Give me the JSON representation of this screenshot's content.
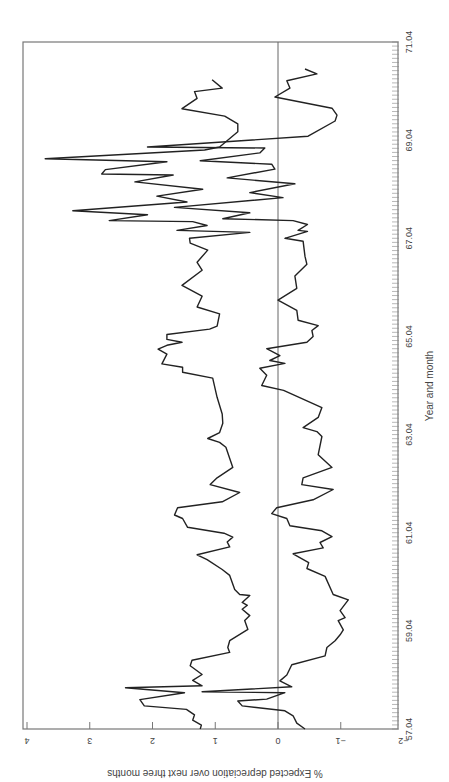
{
  "chart_data": {
    "type": "line",
    "orientation": "rotated 90 degrees clockwise (time axis runs bottom-to-top along right edge)",
    "title": "",
    "xlabel": "Year and month",
    "ylabel": "% Expected depreciation over next three months",
    "x_ticks": [
      "57.04",
      "59.04",
      "61.04",
      "63.04",
      "65.04",
      "67.04",
      "69.04",
      "71.04"
    ],
    "y_ticks": [
      "4",
      "3",
      "2",
      "1",
      "0",
      "−1",
      "−2"
    ],
    "xlim": [
      57.04,
      71.04
    ],
    "ylim": [
      -2,
      4
    ],
    "grid": false,
    "reference_line": {
      "y": 0
    },
    "legend": null,
    "series": [
      {
        "name": "upper band",
        "points": [
          [
            57.04,
            1.24
          ],
          [
            57.12,
            1.22
          ],
          [
            57.22,
            1.36
          ],
          [
            57.33,
            1.33
          ],
          [
            57.44,
            1.46
          ],
          [
            57.51,
            2.13
          ],
          [
            57.64,
            2.2
          ],
          [
            57.78,
            1.49
          ],
          [
            57.88,
            2.43
          ],
          [
            57.92,
            1.21
          ],
          [
            58.03,
            1.36
          ],
          [
            58.15,
            1.21
          ],
          [
            58.33,
            1.4
          ],
          [
            58.44,
            1.37
          ],
          [
            58.6,
            0.77
          ],
          [
            58.7,
            0.8
          ],
          [
            58.84,
            0.77
          ],
          [
            59.07,
            0.48
          ],
          [
            59.25,
            0.53
          ],
          [
            59.35,
            0.45
          ],
          [
            59.48,
            0.57
          ],
          [
            59.56,
            0.49
          ],
          [
            59.62,
            0.57
          ],
          [
            59.76,
            0.45
          ],
          [
            59.78,
            0.61
          ],
          [
            59.88,
            0.69
          ],
          [
            60.17,
            0.77
          ],
          [
            60.29,
            0.89
          ],
          [
            60.49,
            1.13
          ],
          [
            60.59,
            1.29
          ],
          [
            60.75,
            0.77
          ],
          [
            60.85,
            0.81
          ],
          [
            60.95,
            0.72
          ],
          [
            61.03,
            0.86
          ],
          [
            61.15,
            1.44
          ],
          [
            61.33,
            1.52
          ],
          [
            61.4,
            1.65
          ],
          [
            61.55,
            1.6
          ],
          [
            61.67,
            0.89
          ],
          [
            61.86,
            0.61
          ],
          [
            62.02,
            1.08
          ],
          [
            62.16,
            0.97
          ],
          [
            62.37,
            0.72
          ],
          [
            62.78,
            0.83
          ],
          [
            62.88,
            0.93
          ],
          [
            62.96,
            1.12
          ],
          [
            63.08,
            0.93
          ],
          [
            63.27,
            0.88
          ],
          [
            63.46,
            0.89
          ],
          [
            63.8,
            0.97
          ],
          [
            64.19,
            1.04
          ],
          [
            64.31,
            1.52
          ],
          [
            64.41,
            1.52
          ],
          [
            64.48,
            1.85
          ],
          [
            64.68,
            1.77
          ],
          [
            64.78,
            1.91
          ],
          [
            64.86,
            1.77
          ],
          [
            64.92,
            1.53
          ],
          [
            64.98,
            1.77
          ],
          [
            65.08,
            1.77
          ],
          [
            65.19,
            1.09
          ],
          [
            65.25,
            0.97
          ],
          [
            65.5,
            0.93
          ],
          [
            65.64,
            1.29
          ],
          [
            65.86,
            1.21
          ],
          [
            66.08,
            1.53
          ],
          [
            66.39,
            1.21
          ],
          [
            66.55,
            1.29
          ],
          [
            66.8,
            1.12
          ],
          [
            66.94,
            1.4
          ],
          [
            67.04,
            1.41
          ],
          [
            67.16,
            0.45
          ],
          [
            67.2,
            1.61
          ],
          [
            67.3,
            1.13
          ],
          [
            67.38,
            1.36
          ],
          [
            67.4,
            2.69
          ],
          [
            67.52,
            2.08
          ],
          [
            67.6,
            3.27
          ],
          [
            67.78,
            1.45
          ],
          [
            67.9,
            1.93
          ],
          [
            68.04,
            1.2
          ],
          [
            68.19,
            2.28
          ],
          [
            68.33,
            1.67
          ],
          [
            68.35,
            2.81
          ],
          [
            68.44,
            2.75
          ],
          [
            68.6,
            1.77
          ],
          [
            68.66,
            3.71
          ],
          [
            68.84,
            1.17
          ],
          [
            68.9,
            0.93
          ],
          [
            69.21,
            0.64
          ],
          [
            69.37,
            0.64
          ],
          [
            69.53,
            0.85
          ],
          [
            69.68,
            1.53
          ],
          [
            69.89,
            1.29
          ],
          [
            70.03,
            1.33
          ],
          [
            70.1,
            0.89
          ],
          [
            70.27,
            1.05
          ]
        ]
      },
      {
        "name": "lower band",
        "points": [
          [
            57.04,
            -0.43
          ],
          [
            57.16,
            -0.3
          ],
          [
            57.31,
            -0.24
          ],
          [
            57.41,
            -0.11
          ],
          [
            57.51,
            0.57
          ],
          [
            57.61,
            0.64
          ],
          [
            57.65,
            0.18
          ],
          [
            57.78,
            -0.11
          ],
          [
            57.8,
            1.21
          ],
          [
            57.9,
            -0.22
          ],
          [
            58.02,
            -0.03
          ],
          [
            58.14,
            -0.14
          ],
          [
            58.35,
            -0.22
          ],
          [
            58.53,
            -0.75
          ],
          [
            58.7,
            -0.78
          ],
          [
            58.84,
            -0.91
          ],
          [
            58.96,
            -0.99
          ],
          [
            59.06,
            -1.04
          ],
          [
            59.25,
            -0.96
          ],
          [
            59.31,
            -1.07
          ],
          [
            59.45,
            -0.99
          ],
          [
            59.67,
            -1.12
          ],
          [
            59.78,
            -0.88
          ],
          [
            60.15,
            -0.75
          ],
          [
            60.31,
            -0.46
          ],
          [
            60.43,
            -0.49
          ],
          [
            60.61,
            -0.24
          ],
          [
            60.73,
            -0.72
          ],
          [
            60.84,
            -0.67
          ],
          [
            60.96,
            -0.86
          ],
          [
            61.08,
            -0.7
          ],
          [
            61.18,
            -0.19
          ],
          [
            61.33,
            -0.14
          ],
          [
            61.43,
            0.1
          ],
          [
            61.55,
            0.02
          ],
          [
            61.71,
            -0.56
          ],
          [
            61.92,
            -0.88
          ],
          [
            62.02,
            -0.38
          ],
          [
            62.16,
            -0.4
          ],
          [
            62.37,
            -0.86
          ],
          [
            62.63,
            -0.64
          ],
          [
            63.0,
            -0.7
          ],
          [
            63.1,
            -0.62
          ],
          [
            63.18,
            -0.4
          ],
          [
            63.39,
            -0.64
          ],
          [
            63.59,
            -0.7
          ],
          [
            63.94,
            -0.09
          ],
          [
            64.04,
            0.26
          ],
          [
            64.25,
            0.18
          ],
          [
            64.39,
            0.29
          ],
          [
            64.49,
            -0.11
          ],
          [
            64.55,
            0.13
          ],
          [
            64.65,
            -0.03
          ],
          [
            64.79,
            0.18
          ],
          [
            64.92,
            -0.46
          ],
          [
            65.04,
            -0.56
          ],
          [
            65.16,
            -0.54
          ],
          [
            65.26,
            -0.64
          ],
          [
            65.37,
            -0.32
          ],
          [
            65.57,
            -0.3
          ],
          [
            65.78,
            0.0
          ],
          [
            66.02,
            -0.3
          ],
          [
            66.27,
            -0.27
          ],
          [
            66.51,
            -0.46
          ],
          [
            66.67,
            -0.43
          ],
          [
            66.98,
            -0.4
          ],
          [
            67.04,
            -0.11
          ],
          [
            67.18,
            -0.47
          ],
          [
            67.2,
            -0.32
          ],
          [
            67.32,
            -0.47
          ],
          [
            67.4,
            -0.24
          ],
          [
            67.44,
            0.88
          ],
          [
            67.56,
            0.45
          ],
          [
            67.67,
            1.65
          ],
          [
            67.87,
            -0.08
          ],
          [
            67.97,
            0.45
          ],
          [
            68.15,
            -0.27
          ],
          [
            68.27,
            0.81
          ],
          [
            68.45,
            0.05
          ],
          [
            68.55,
            0.1
          ],
          [
            68.62,
            1.24
          ],
          [
            68.78,
            0.29
          ],
          [
            68.88,
            0.21
          ],
          [
            68.9,
            2.08
          ],
          [
            69.12,
            -0.48
          ],
          [
            69.43,
            -0.91
          ],
          [
            69.55,
            -0.94
          ],
          [
            69.69,
            -0.86
          ],
          [
            69.92,
            0.05
          ],
          [
            70.1,
            -0.19
          ],
          [
            70.25,
            -0.14
          ],
          [
            70.39,
            -0.62
          ],
          [
            70.49,
            -0.43
          ]
        ]
      }
    ]
  }
}
